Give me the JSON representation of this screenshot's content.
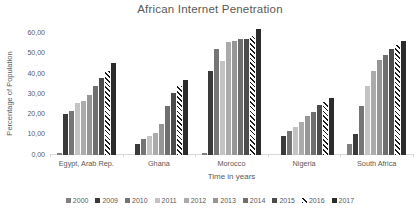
{
  "title": "African Internet Penetration",
  "colors": {
    "text": "#595959",
    "axis_line": "#d9d9d9",
    "hatch_foreground": "#1a1a1a",
    "hatch_background": "#ffffff"
  },
  "chart_data": {
    "type": "bar",
    "title": "African Internet Penetration",
    "xlabel": "Time in years",
    "ylabel": "Percentage of Population",
    "ylim": [
      0,
      60
    ],
    "ytick_labels": [
      "0,00",
      "10,00",
      "20,00",
      "30,00",
      "40,00",
      "50,00",
      "60,00"
    ],
    "ytick_values": [
      0,
      10,
      20,
      30,
      40,
      50,
      60
    ],
    "grid": false,
    "legend_position": "bottom",
    "categories": [
      "Egypt, Arab Rep.",
      "Ghana",
      "Morocco",
      "Nigeria",
      "South Africa"
    ],
    "series": [
      {
        "name": "2000",
        "color": "#808080",
        "pattern": "solid",
        "values": [
          0.64,
          0.15,
          0.69,
          0.06,
          5.35
        ]
      },
      {
        "name": "2009",
        "color": "#3a3a3a",
        "pattern": "dotted",
        "values": [
          20.0,
          5.4,
          41.3,
          9.3,
          10.0
        ]
      },
      {
        "name": "2010",
        "color": "#757575",
        "pattern": "solid",
        "values": [
          21.6,
          7.8,
          52.0,
          11.5,
          24.0
        ]
      },
      {
        "name": "2011",
        "color": "#c3c3c3",
        "pattern": "dotted",
        "values": [
          25.6,
          9.0,
          46.1,
          13.8,
          34.0
        ]
      },
      {
        "name": "2012",
        "color": "#ababab",
        "pattern": "solid",
        "values": [
          26.4,
          10.6,
          55.4,
          16.1,
          41.0
        ]
      },
      {
        "name": "2013",
        "color": "#969696",
        "pattern": "dotted",
        "values": [
          29.4,
          14.9,
          56.0,
          19.1,
          46.5
        ]
      },
      {
        "name": "2014",
        "color": "#6f6f6f",
        "pattern": "dotted",
        "values": [
          33.9,
          23.8,
          56.8,
          21.0,
          49.0
        ]
      },
      {
        "name": "2015",
        "color": "#4c4c4c",
        "pattern": "solid",
        "values": [
          37.8,
          30.3,
          57.1,
          24.5,
          51.9
        ]
      },
      {
        "name": "2016",
        "color": "#1f1f1f",
        "pattern": "diagonal-hatch",
        "values": [
          41.2,
          34.0,
          58.3,
          25.7,
          54.0
        ]
      },
      {
        "name": "2017",
        "color": "#2b2b2b",
        "pattern": "dotted",
        "values": [
          45.0,
          37.0,
          61.8,
          27.7,
          56.2
        ]
      }
    ]
  }
}
